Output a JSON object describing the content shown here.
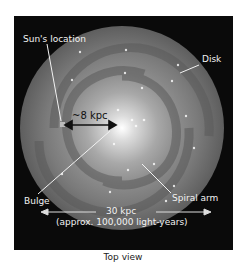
{
  "diagram": {
    "labels": {
      "sun": "Sun's location",
      "disk": "Disk",
      "distance": "~8 kpc",
      "bulge": "Bulge",
      "spiral_arm": "Spiral arm",
      "diameter": "30 kpc",
      "diameter_note": "(approx. 100,000 light-years)"
    },
    "caption": "Top view",
    "colors": {
      "background": "#0a0a0a",
      "galaxy_outer": "#6e6e6e",
      "galaxy_core": "#f5f5f5",
      "label": "#f2f2f2"
    }
  }
}
